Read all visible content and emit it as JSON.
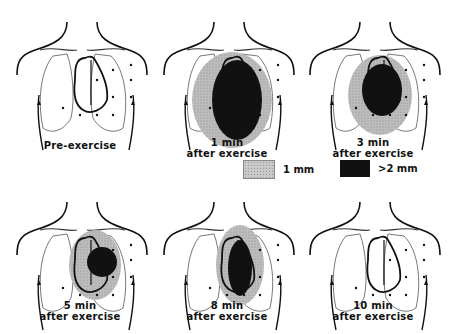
{
  "figure": {
    "panels": [
      {
        "id": "pre",
        "line1": "",
        "line2": "Pre-exercise",
        "light": null,
        "dark": null
      },
      {
        "id": "1min",
        "line1": "1 min",
        "line2": "after exercise",
        "light": {
          "cx": 80,
          "cy": 100,
          "rx": 40,
          "ry": 48
        },
        "dark": {
          "cx": 85,
          "cy": 100,
          "rx": 25,
          "ry": 40
        }
      },
      {
        "id": "3min",
        "line1": "3 min",
        "line2": "after exercise",
        "light": {
          "cx": 82,
          "cy": 95,
          "rx": 32,
          "ry": 40
        },
        "dark": {
          "cx": 84,
          "cy": 90,
          "rx": 20,
          "ry": 26
        }
      },
      {
        "id": "5min",
        "line1": "5 min",
        "line2": "after exercise",
        "light": {
          "cx": 90,
          "cy": 85,
          "rx": 26,
          "ry": 35
        },
        "dark": {
          "cx": 97,
          "cy": 82,
          "rx": 15,
          "ry": 15
        }
      },
      {
        "id": "8min",
        "line1": "8 min",
        "line2": "after exercise",
        "light": {
          "cx": 88,
          "cy": 85,
          "rx": 24,
          "ry": 40
        },
        "dark": {
          "cx": 88,
          "cy": 88,
          "rx": 12,
          "ry": 28
        }
      },
      {
        "id": "10min",
        "line1": "10 min",
        "line2": "after exercise",
        "light": null,
        "dark": null
      }
    ],
    "legend": {
      "light_label": "1 mm",
      "dark_label": ">2 mm"
    }
  }
}
